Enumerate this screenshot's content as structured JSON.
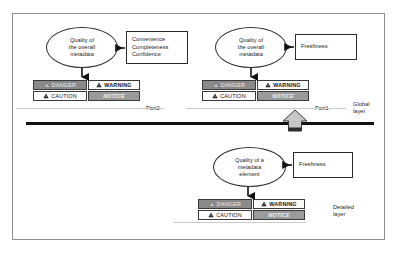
{
  "diagram": {
    "layers": [
      {
        "id": "global",
        "caption": "Global\nlayer",
        "parts": [
          {
            "id": "part2",
            "part_label": "Part2",
            "ellipse_text": "Quality of\nthe overall\nmetadata",
            "attribute_box_text": "Convenience\nCompleteness\nConfidence",
            "signal_words": [
              {
                "label": "DANGER",
                "style": "danger",
                "icon": "warning-triangle-icon"
              },
              {
                "label": "WARNING",
                "style": "warning",
                "icon": "warning-triangle-icon"
              },
              {
                "label": "CAUTION",
                "style": "caution",
                "icon": "warning-triangle-icon"
              },
              {
                "label": "NOTICE",
                "style": "notice",
                "icon": "none"
              }
            ]
          },
          {
            "id": "part1",
            "part_label": "Part1",
            "ellipse_text": "Quality of\nthe overall\nmetadata",
            "attribute_box_text": "Freshness",
            "signal_words": [
              {
                "label": "DANGER",
                "style": "danger",
                "icon": "warning-triangle-icon"
              },
              {
                "label": "WARNING",
                "style": "warning",
                "icon": "warning-triangle-icon"
              },
              {
                "label": "CAUTION",
                "style": "caution",
                "icon": "warning-triangle-icon"
              },
              {
                "label": "NOTICE",
                "style": "notice",
                "icon": "none"
              }
            ]
          }
        ]
      },
      {
        "id": "detailed",
        "caption": "Detailed\nlayer",
        "parts": [
          {
            "id": "detail-element",
            "part_label": "",
            "ellipse_text": "Quality of a\nmetadata\nelement",
            "attribute_box_text": "Freshness",
            "signal_words": [
              {
                "label": "DANGER",
                "style": "danger",
                "icon": "warning-triangle-icon"
              },
              {
                "label": "WARNING",
                "style": "warning",
                "icon": "warning-triangle-icon"
              },
              {
                "label": "CAUTION",
                "style": "caution",
                "icon": "warning-triangle-icon"
              },
              {
                "label": "NOTICE",
                "style": "notice",
                "icon": "none"
              }
            ]
          }
        ]
      }
    ],
    "connectors": {
      "layer_divider": "thick-horizontal-rule",
      "aggregation_arrow": "block-arrow-up",
      "attribute_arrow": "arrow-left",
      "evaluation_arrow": "arrow-down"
    },
    "colors": {
      "danger_fill": "#8a8a8a",
      "warning_fill": "#fbfbfb",
      "caution_fill": "#fdfdfd",
      "notice_fill": "#9a9a9a",
      "frame_border": "#8f8f8f",
      "divider": "#121212"
    }
  }
}
